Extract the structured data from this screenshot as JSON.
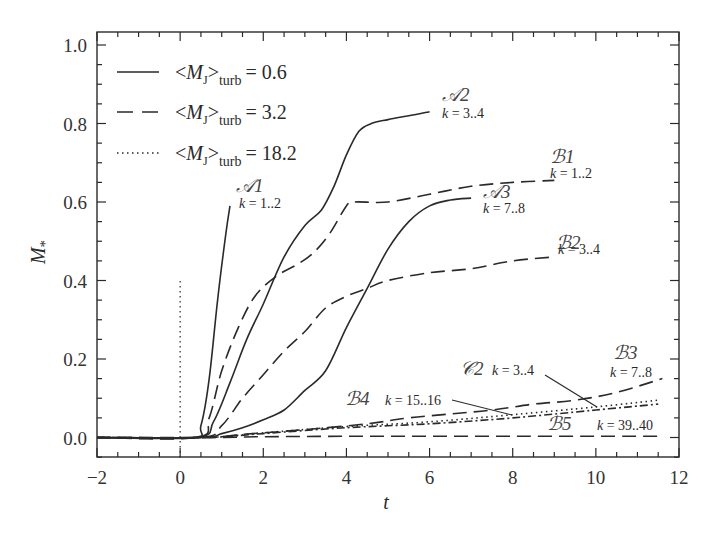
{
  "chart_data": {
    "type": "line",
    "title": "",
    "xlabel": "t",
    "ylabel": "M*",
    "xlim": [
      -2,
      12
    ],
    "ylim": [
      -0.05,
      1.0
    ],
    "xticks": [
      -2,
      0,
      2,
      4,
      6,
      8,
      10,
      12
    ],
    "xtick_labels": [
      "−2",
      "0",
      "2",
      "4",
      "6",
      "8",
      "10",
      "12"
    ],
    "yticks": [
      0.0,
      0.2,
      0.4,
      0.6,
      0.8,
      1.0
    ],
    "ytick_labels": [
      "0.0",
      "0.2",
      "0.4",
      "0.6",
      "0.8",
      "1.0"
    ],
    "grid": false,
    "legend_position": "upper left",
    "legend": [
      {
        "style": "solid",
        "label": "<M_J>_turb = 0.6",
        "main": "<M",
        "sub_j": "J",
        "close": ">",
        "sub": "turb",
        "value": "= 0.6"
      },
      {
        "style": "dashed",
        "label": "<M_J>_turb = 3.2",
        "main": "<M",
        "sub_j": "J",
        "close": ">",
        "sub": "turb",
        "value": "= 3.2"
      },
      {
        "style": "dotted",
        "label": "<M_J>_turb = 18.2",
        "main": "<M",
        "sub_j": "J",
        "close": ">",
        "sub": "turb",
        "value": "= 18.2"
      }
    ],
    "reference_line": {
      "x": 0,
      "y_range": [
        0,
        0.4
      ],
      "style": "dotted"
    },
    "series": [
      {
        "name": "A1",
        "label": "𝒜1",
        "k": "k = 1..2",
        "style": "solid",
        "x": [
          -2,
          0.3,
          0.5,
          0.7,
          0.9,
          1.1,
          1.2
        ],
        "y": [
          0,
          0,
          0.03,
          0.15,
          0.35,
          0.52,
          0.59
        ]
      },
      {
        "name": "A2",
        "label": "𝒜2",
        "k": "k = 3..4",
        "style": "solid",
        "x": [
          -2,
          0.4,
          0.8,
          1.2,
          1.6,
          2.0,
          2.5,
          3.0,
          3.4,
          3.7,
          4.0,
          4.3,
          4.6,
          5.0,
          5.5,
          6.0
        ],
        "y": [
          0,
          0,
          0.04,
          0.14,
          0.25,
          0.34,
          0.46,
          0.54,
          0.58,
          0.64,
          0.72,
          0.78,
          0.8,
          0.81,
          0.82,
          0.83
        ]
      },
      {
        "name": "A3",
        "label": "𝒜3",
        "k": "k = 7..8",
        "style": "solid",
        "x": [
          -2,
          0.5,
          1.0,
          1.5,
          2.0,
          2.5,
          3.0,
          3.5,
          4.0,
          4.5,
          5.0,
          5.5,
          6.0,
          6.5,
          7.0
        ],
        "y": [
          0,
          0,
          0.01,
          0.025,
          0.045,
          0.07,
          0.12,
          0.17,
          0.28,
          0.38,
          0.48,
          0.55,
          0.59,
          0.605,
          0.61
        ]
      },
      {
        "name": "B1",
        "label": "ℬ1",
        "k": "k = 1..2",
        "style": "dashed",
        "x": [
          -2,
          0.4,
          0.7,
          1.0,
          1.4,
          1.8,
          2.3,
          2.8,
          3.2,
          3.6,
          4.0,
          4.2,
          5.0,
          6.0,
          7.0,
          8.0,
          9.0
        ],
        "y": [
          0,
          0,
          0.05,
          0.17,
          0.28,
          0.36,
          0.41,
          0.44,
          0.47,
          0.52,
          0.59,
          0.6,
          0.6,
          0.62,
          0.64,
          0.65,
          0.655
        ]
      },
      {
        "name": "B2",
        "label": "ℬ2",
        "k": "k = 3..4",
        "style": "dashed",
        "x": [
          -2,
          0.5,
          1.0,
          1.5,
          2.0,
          2.5,
          3.0,
          3.5,
          4.0,
          4.5,
          5.0,
          6.0,
          7.0,
          8.0,
          9.0
        ],
        "y": [
          0,
          0,
          0.03,
          0.1,
          0.16,
          0.22,
          0.27,
          0.33,
          0.36,
          0.38,
          0.4,
          0.42,
          0.43,
          0.45,
          0.46
        ]
      },
      {
        "name": "B3",
        "label": "ℬ3",
        "k": "k = 7..8",
        "style": "dashed",
        "x": [
          -2,
          0.6,
          1.5,
          3.0,
          4.5,
          5.5,
          6.5,
          7.5,
          8.5,
          9.5,
          10.5,
          11.6
        ],
        "y": [
          0,
          0,
          0.008,
          0.02,
          0.035,
          0.05,
          0.06,
          0.07,
          0.085,
          0.095,
          0.115,
          0.15
        ]
      },
      {
        "name": "B4",
        "label": "ℬ4",
        "k": "k = 15..16",
        "style": "dash-dot",
        "x": [
          -2,
          0.6,
          2.0,
          4.0,
          6.0,
          8.0,
          10.0,
          11.5
        ],
        "y": [
          0,
          0,
          0.01,
          0.025,
          0.035,
          0.05,
          0.07,
          0.085
        ]
      },
      {
        "name": "B5",
        "label": "ℬ5",
        "k": "k = 39..40",
        "style": "dashed",
        "x": [
          -2,
          0.6,
          2.0,
          4.0,
          6.0,
          8.0,
          10.0,
          11.5
        ],
        "y": [
          0,
          0,
          0.002,
          0.003,
          0.003,
          0.003,
          0.003,
          0.003
        ]
      },
      {
        "name": "C2",
        "label": "𝒞2",
        "k": "k = 3..4",
        "style": "dotted",
        "x": [
          -2,
          0.6,
          2.0,
          4.0,
          6.0,
          8.0,
          10.0,
          11.5
        ],
        "y": [
          0,
          0,
          0.012,
          0.028,
          0.04,
          0.058,
          0.078,
          0.095
        ]
      }
    ],
    "annotations": [
      {
        "name": "A1",
        "text": "𝒜1",
        "k": "k = 1..2"
      },
      {
        "name": "A2",
        "text": "𝒜2",
        "k": "k = 3..4"
      },
      {
        "name": "A3",
        "text": "𝒜3",
        "k": "k = 7..8"
      },
      {
        "name": "B1",
        "text": "ℬ1",
        "k": "k = 1..2"
      },
      {
        "name": "B2",
        "text": "ℬ2",
        "k": "k = 3..4"
      },
      {
        "name": "B3",
        "text": "ℬ3",
        "k": "k = 7..8"
      },
      {
        "name": "B4",
        "text": "ℬ4",
        "k": "k = 15..16"
      },
      {
        "name": "B5",
        "text": "ℬ5",
        "k": "k = 39..40"
      },
      {
        "name": "C2",
        "text": "𝒞2",
        "k": "k = 3..4"
      }
    ]
  },
  "labels": {
    "x_axis": "t",
    "y_axis_main": "M",
    "y_axis_sub": "*"
  }
}
